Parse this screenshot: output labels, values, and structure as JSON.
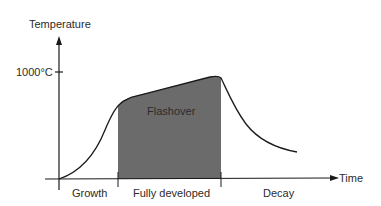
{
  "diagram": {
    "y_axis_label": "Temperature",
    "x_axis_label": "Time",
    "y_tick_label": "1000°C",
    "region_label": "Flashover",
    "phases": [
      {
        "label": "Growth"
      },
      {
        "label": "Fully developed"
      },
      {
        "label": "Decay"
      }
    ],
    "colors": {
      "line": "#1a1a1a",
      "shade": "#6b6b6b",
      "text": "#2b2b2b"
    }
  }
}
